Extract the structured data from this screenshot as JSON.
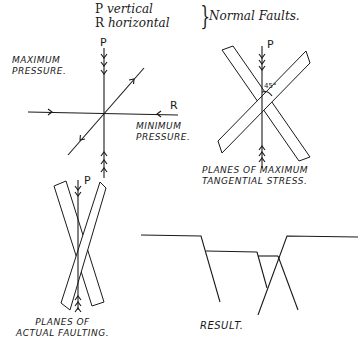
{
  "legend": {
    "rows": [
      {
        "letter": "P",
        "desc": "vertical"
      },
      {
        "letter": "R",
        "desc": "horizontal"
      }
    ],
    "brace": "}",
    "title": "Normal Faults."
  },
  "figure_stress_axes": {
    "label_max": [
      "MAXIMUM",
      "PRESSURE."
    ],
    "label_min": [
      "MINIMUM",
      "PRESSURE."
    ],
    "p_label": "P",
    "r_label": "R"
  },
  "figure_tangential": {
    "p_label": "P",
    "angle_label": "45°",
    "caption": [
      "PLANES OF MAXIMUM",
      "TANGENTIAL STRESS."
    ]
  },
  "figure_actual": {
    "p_label": "P",
    "caption": [
      "PLANES OF",
      "ACTUAL FAULTING."
    ]
  },
  "figure_result": {
    "caption": "RESULT."
  }
}
